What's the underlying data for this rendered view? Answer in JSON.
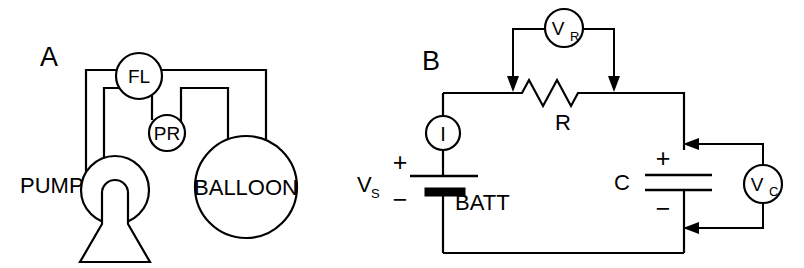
{
  "figure": {
    "background_color": "#ffffff",
    "line_color": "#000000",
    "width": 804,
    "height": 268
  },
  "panels": [
    {
      "id": "A",
      "letter": "A",
      "name": "hydraulic-analogy",
      "components": [
        {
          "name": "pump",
          "label": "PUMP",
          "icon": "pump-icon"
        },
        {
          "name": "flow-meter",
          "label": "FL",
          "icon": "flow-meter-icon"
        },
        {
          "name": "pressure-meter",
          "label": "PR",
          "icon": "pressure-meter-icon"
        },
        {
          "name": "balloon",
          "label": "BALLOON",
          "icon": "balloon-icon"
        }
      ]
    },
    {
      "id": "B",
      "letter": "B",
      "name": "rc-circuit",
      "components": [
        {
          "name": "battery",
          "label": "BATT",
          "icon": "battery-icon"
        },
        {
          "name": "source-voltage",
          "label": "V",
          "sublabel": "S"
        },
        {
          "name": "current-meter",
          "label": "I",
          "icon": "ammeter-icon"
        },
        {
          "name": "resistor",
          "label": "R",
          "icon": "resistor-icon"
        },
        {
          "name": "resistor-voltmeter",
          "label": "V",
          "sublabel": "R",
          "icon": "voltmeter-icon"
        },
        {
          "name": "capacitor",
          "label": "C",
          "icon": "capacitor-icon"
        },
        {
          "name": "capacitor-voltmeter",
          "label": "V",
          "sublabel": "C",
          "icon": "voltmeter-icon"
        }
      ],
      "polarity": {
        "battery_plus": "+",
        "battery_minus": "−",
        "capacitor_plus": "+",
        "capacitor_minus": "−"
      }
    }
  ],
  "labels": {
    "panel_a_letter": "A",
    "panel_b_letter": "B",
    "pump": "PUMP",
    "flow_meter": "FL",
    "pressure_meter": "PR",
    "balloon": "BALLOON",
    "battery": "BATT",
    "source_v": "V",
    "source_v_sub": "S",
    "ammeter": "I",
    "resistor": "R",
    "resistor_v": "V",
    "resistor_v_sub": "R",
    "capacitor": "C",
    "capacitor_v": "V",
    "capacitor_v_sub": "C",
    "plus": "+",
    "minus": "−"
  }
}
